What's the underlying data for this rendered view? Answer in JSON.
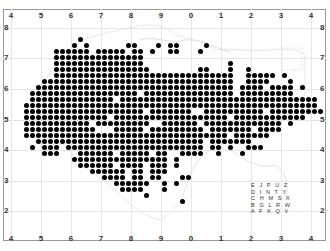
{
  "map": {
    "x_axis_labels": [
      "4",
      "5",
      "6",
      "7",
      "8",
      "9",
      "0",
      "1",
      "2",
      "3",
      "4"
    ],
    "y_axis_labels": [
      "8",
      "7",
      "6",
      "5",
      "4",
      "3",
      "2"
    ],
    "colors": {
      "dot": "#000000",
      "gridline": "#e6e6e6",
      "frame": "#9a9a9a",
      "coastline": "#d8d8d8"
    },
    "dot_grid": {
      "origin_x": 20,
      "origin_y": 39,
      "pitch": 6,
      "rows": [
        "..........#........................................",
        ".........#.#......##...#.##....#.......................",
        "......######.#####.##.#..##...#......................",
        "......###############...........................",
        "......###############..............#............",
        "......################........##...#..#.........",
        "......##############################..#####.#....",
        "....################################..####...#...",
        "...#################################.####.####.#.",
        "..##################.###############.#########...",
        "..##############.#################################",
        ".#################################################",
        ".####################.#######..##########.#########",
        ".##############.###################.############...",
        ".###########.#########..######.#############.#...",
        ".############...#####.#########.#######.####....",
        ".##################################.######.......",
        "...############################.#######.........",
        "..#.###.#######################.##.#..###.......",
        "....###...######.#####.##..####..#...#..........",
        ".........################.#.....................",
        "..........######.####.###.#.....................",
        "............######.##.###.......................",
        "..............####.##.##...##...................",
        "................######..#.#.....................",
        ".................####...#.......................",
        ".....................#...........................",
        "...........................#....................."
      ]
    },
    "legend": {
      "rows": [
        [
          "E",
          "J",
          "P",
          "U",
          "Z"
        ],
        [
          "D",
          "I",
          "N",
          "T",
          "Y"
        ],
        [
          "C",
          "H",
          "M",
          "S",
          "X"
        ],
        [
          "B",
          "G",
          "L",
          "R",
          "W"
        ],
        [
          "A",
          "F",
          "K",
          "Q",
          "V"
        ]
      ]
    }
  }
}
